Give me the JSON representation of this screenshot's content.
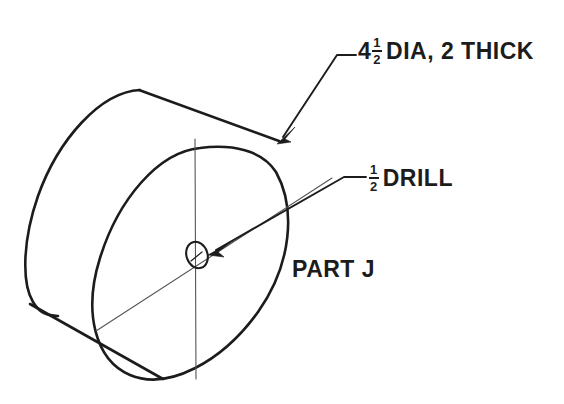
{
  "drawing": {
    "title": "Isometric pictorial drawing of cylindrical part with through hole",
    "background_color": "#ffffff",
    "line_color": "#1c1c1c",
    "center_line_color": "#555555",
    "notes": {
      "diameter_note": {
        "whole": "4",
        "numerator": "1",
        "denominator": "2",
        "text": "DIA, 2 THICK",
        "full": "4 1/2 DIA, 2 THICK"
      },
      "drill_note": {
        "numerator": "1",
        "denominator": "2",
        "text": "DRILL",
        "full": "1/2 DRILL"
      },
      "part_label": "PART J"
    },
    "geometry": {
      "front_face_ellipse": {
        "center_x": 196,
        "center_y": 258,
        "radius_x": 100,
        "radius_y": 118,
        "rotation_deg": -18
      },
      "back_face_ellipse": {
        "center_x": 110,
        "center_y": 205,
        "radius_x": 100,
        "radius_y": 118,
        "rotation_deg": -18
      },
      "hole_ellipse": {
        "center_x": 197,
        "center_y": 255,
        "radius_x": 10,
        "radius_y": 13,
        "rotation_deg": -18
      }
    }
  }
}
